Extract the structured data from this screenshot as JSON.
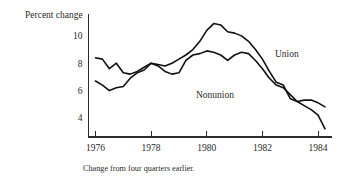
{
  "chart_data": {
    "type": "line",
    "title": "",
    "subtitle": "",
    "xlabel": "",
    "ylabel": "Percent change",
    "caption": "Change from four quarters earlier.",
    "grid": false,
    "legend_position": "inline-annotation",
    "xlim": [
      1975.75,
      1984.5
    ],
    "ylim": [
      2.6,
      11.6
    ],
    "xticks": [
      1976,
      1978,
      1980,
      1982,
      1984
    ],
    "xtick_labels": [
      "1976",
      "1978",
      "1980",
      "1982",
      "1984"
    ],
    "yticks": [
      4,
      6,
      8,
      10
    ],
    "ytick_labels": [
      "4",
      "6",
      "8",
      "10"
    ],
    "series": [
      {
        "name": "Union",
        "label": "Union",
        "x": [
          1976.0,
          1976.25,
          1976.5,
          1976.75,
          1977.0,
          1977.25,
          1977.5,
          1977.75,
          1978.0,
          1978.25,
          1978.5,
          1978.75,
          1979.0,
          1979.25,
          1979.5,
          1979.75,
          1980.0,
          1980.25,
          1980.5,
          1980.75,
          1981.0,
          1981.25,
          1981.5,
          1981.75,
          1982.0,
          1982.25,
          1982.5,
          1982.75,
          1983.0,
          1983.25,
          1983.5,
          1983.75,
          1984.0,
          1984.25
        ],
        "values": [
          8.4,
          8.3,
          7.6,
          8.0,
          7.3,
          7.2,
          7.4,
          7.7,
          8.0,
          7.9,
          7.8,
          8.0,
          8.3,
          8.6,
          9.0,
          9.6,
          10.4,
          10.9,
          10.8,
          10.3,
          10.2,
          10.0,
          9.6,
          9.0,
          8.3,
          7.4,
          6.6,
          6.4,
          5.4,
          5.2,
          4.9,
          4.6,
          4.2,
          3.2
        ]
      },
      {
        "name": "Nonunion",
        "label": "Nonunion",
        "x": [
          1976.0,
          1976.25,
          1976.5,
          1976.75,
          1977.0,
          1977.25,
          1977.5,
          1977.75,
          1978.0,
          1978.25,
          1978.5,
          1978.75,
          1979.0,
          1979.25,
          1979.5,
          1979.75,
          1980.0,
          1980.25,
          1980.5,
          1980.75,
          1981.0,
          1981.25,
          1981.5,
          1981.75,
          1982.0,
          1982.25,
          1982.5,
          1982.75,
          1983.0,
          1983.25,
          1983.5,
          1983.75,
          1984.0,
          1984.25
        ],
        "values": [
          6.7,
          6.4,
          6.0,
          6.2,
          6.3,
          6.9,
          7.3,
          7.5,
          8.0,
          7.8,
          7.4,
          7.2,
          7.3,
          8.2,
          8.6,
          8.7,
          8.9,
          8.8,
          8.6,
          8.2,
          8.6,
          8.8,
          8.7,
          8.2,
          7.6,
          6.9,
          6.4,
          6.2,
          5.7,
          5.2,
          5.3,
          5.3,
          5.1,
          4.8
        ]
      }
    ]
  },
  "annotations": {
    "union_label": "Union",
    "nonunion_label": "Nonunion"
  }
}
